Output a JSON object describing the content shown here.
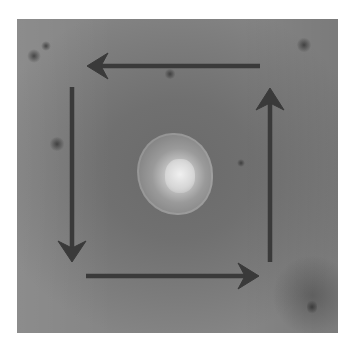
{
  "figure": {
    "arrows": [
      {
        "name": "top-arrow",
        "direction": "left",
        "from": [
          260,
          66
        ],
        "to": [
          87,
          66
        ]
      },
      {
        "name": "left-arrow",
        "direction": "down",
        "from": [
          72,
          87
        ],
        "to": [
          72,
          262
        ]
      },
      {
        "name": "bottom-arrow",
        "direction": "right",
        "from": [
          86,
          276
        ],
        "to": [
          259,
          276
        ]
      },
      {
        "name": "right-arrow",
        "direction": "up",
        "from": [
          270,
          262
        ],
        "to": [
          270,
          88
        ]
      }
    ],
    "rotation": "counter-clockwise",
    "arrow_color": "#3a3a3a",
    "background_color": "#777777",
    "lesion_color": "#e0e0e0"
  }
}
